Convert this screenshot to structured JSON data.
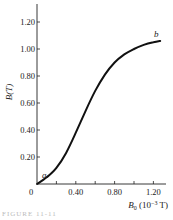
{
  "chart_data": {
    "type": "line",
    "title": "",
    "xlabel": "B₀ (10⁻³ T)",
    "xlabel_parts": {
      "symbol": "B",
      "subscript": "0",
      "unit": "(10",
      "exponent": "−3",
      "unit_end": " T)"
    },
    "ylabel": "B(T)",
    "xlim": [
      0,
      1.32
    ],
    "ylim": [
      0,
      1.32
    ],
    "x_ticks": [
      0,
      0.2,
      0.4,
      0.6,
      0.8,
      1.0,
      1.2
    ],
    "x_tick_labels": [
      "0",
      "",
      "0.40",
      "",
      "0.80",
      "",
      "1.20"
    ],
    "y_ticks": [
      0.2,
      0.4,
      0.6,
      0.8,
      1.0,
      1.2
    ],
    "y_tick_labels": [
      "0.20",
      "0.40",
      "0.60",
      "0.80",
      "1.00",
      "1.20"
    ],
    "grid": false,
    "legend": null,
    "series": [
      {
        "name": "B vs B0 (magnetization curve)",
        "x": [
          0.0,
          0.1,
          0.2,
          0.3,
          0.4,
          0.5,
          0.6,
          0.7,
          0.8,
          0.9,
          1.0,
          1.1,
          1.2,
          1.27
        ],
        "y": [
          0.0,
          0.05,
          0.12,
          0.23,
          0.38,
          0.54,
          0.69,
          0.81,
          0.9,
          0.96,
          1.0,
          1.03,
          1.05,
          1.06
        ]
      }
    ],
    "annotations": [
      {
        "text": "a",
        "x": 0.03,
        "y": 0.04
      },
      {
        "text": "b",
        "x": 1.26,
        "y": 1.1
      }
    ]
  },
  "labels": {
    "origin": "0",
    "x_tick_040": "0.40",
    "x_tick_080": "0.80",
    "x_tick_120": "1.20",
    "y_tick_020": "0.20",
    "y_tick_040": "0.40",
    "y_tick_060": "0.60",
    "y_tick_080": "0.80",
    "y_tick_100": "1.00",
    "y_tick_120": "1.20",
    "ylabel": "B(T)",
    "xlabel_symbol": "B",
    "xlabel_sub": "0",
    "xlabel_unit": " (10",
    "xlabel_exp": "−3",
    "xlabel_unit_end": " T)",
    "point_a": "a",
    "point_b": "b"
  },
  "caption": "FIGURE 11-11"
}
